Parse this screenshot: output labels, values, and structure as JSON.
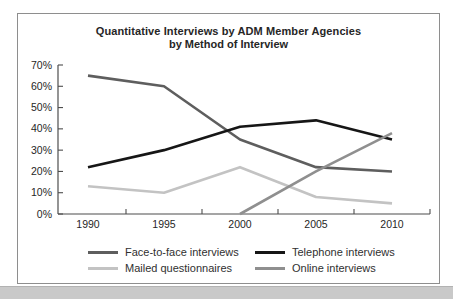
{
  "chart_data": {
    "type": "line",
    "title": "Quantitative Interviews by ADM Member Agencies",
    "subtitle": "by Method of Interview",
    "x_labels": [
      "1990",
      "1995",
      "2000",
      "2005",
      "2010"
    ],
    "y_tick_labels": [
      "0%",
      "10%",
      "20%",
      "30%",
      "40%",
      "50%",
      "60%",
      "70%"
    ],
    "ylim": [
      0,
      70
    ],
    "grid": false,
    "legend_position": "bottom",
    "axis_color": "#4d4d4d",
    "text_color": "#262626",
    "series": [
      {
        "name": "Face-to-face interviews",
        "color": "#5e5e5e",
        "values": [
          65,
          60,
          35,
          22,
          20
        ]
      },
      {
        "name": "Telephone interviews",
        "color": "#161616",
        "values": [
          22,
          30,
          41,
          44,
          35
        ]
      },
      {
        "name": "Mailed questionnaires",
        "color": "#c3c3c3",
        "values": [
          13,
          10,
          22,
          8,
          5
        ]
      },
      {
        "name": "Online interviews",
        "color": "#8f8f8f",
        "values": [
          null,
          null,
          0,
          20,
          38
        ]
      }
    ]
  },
  "frame": {
    "border_color": "#8e8e8e",
    "background": "#ffffff"
  },
  "bottom_bar": {
    "color": "#c9c9c9"
  }
}
